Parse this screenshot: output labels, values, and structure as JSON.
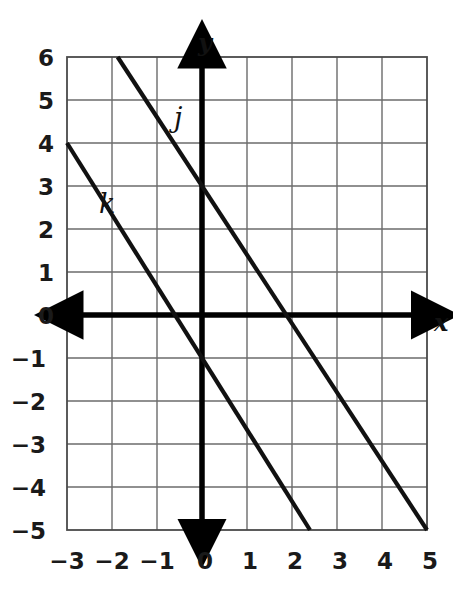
{
  "figure": {
    "type": "coordinate-graph",
    "background_color": "#ffffff",
    "grid_color": "#6b6b6b",
    "axis_color": "#000000",
    "line_color": "#111111"
  },
  "axes": {
    "x_label": "x",
    "y_label": "y",
    "x_ticks": [
      "−3",
      "−2",
      "−1",
      "0",
      "1",
      "2",
      "3",
      "4",
      "5"
    ],
    "y_ticks": [
      "6",
      "5",
      "4",
      "3",
      "2",
      "1",
      "0",
      "−1",
      "−2",
      "−3",
      "−4",
      "−5"
    ],
    "xlim": [
      -3,
      5
    ],
    "ylim": [
      -5,
      6
    ],
    "grid": true,
    "grid_step": 1
  },
  "chart_data": {
    "type": "line",
    "title": "",
    "xlabel": "x",
    "ylabel": "y",
    "xlim": [
      -3,
      5
    ],
    "ylim": [
      -5,
      6
    ],
    "grid": true,
    "legend": "inline-labels",
    "series": [
      {
        "name": "j",
        "label": "j",
        "slope": -1.6,
        "y_intercept": 3,
        "x_intercept": 2,
        "points": [
          [
            -2,
            6
          ],
          [
            0,
            3
          ],
          [
            2,
            0
          ],
          [
            5,
            -5
          ]
        ],
        "label_position": [
          -0.55,
          4.45
        ]
      },
      {
        "name": "k",
        "label": "k",
        "slope": -1.6667,
        "y_intercept": -1,
        "x_intercept": -0.6,
        "points": [
          [
            -3,
            4
          ],
          [
            0,
            -1
          ],
          [
            2.4,
            -5
          ]
        ],
        "label_position": [
          -1.6,
          2.3
        ]
      }
    ]
  }
}
